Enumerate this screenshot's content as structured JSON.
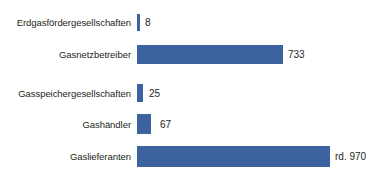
{
  "chart_data": {
    "type": "bar",
    "orientation": "horizontal",
    "title": "",
    "subtitle": "",
    "xlabel": "",
    "ylabel": "",
    "grid": false,
    "legend": null,
    "xlim": [
      0,
      970
    ],
    "bar_color": "#3d62a0",
    "background_color": "#ffffff",
    "label_color": "#231f20",
    "categories": [
      "Erdgasfördergesellschaften",
      "Gasnetzbetreiber",
      "Gasspeichergesellschaften",
      "Gashändler",
      "Gaslieferanten"
    ],
    "values": [
      8,
      733,
      25,
      67,
      970
    ],
    "value_labels": [
      "8",
      "733",
      "25",
      "67",
      "rd. 970"
    ],
    "bars": [
      {
        "category": "Erdgasfördergesellschaften",
        "value": 8,
        "value_label": "8",
        "bar_px": 3
      },
      {
        "category": "Gasnetzbetreiber",
        "value": 733,
        "value_label": "733",
        "bar_px": 146
      },
      {
        "category": "Gasspeichergesellschaften",
        "value": 25,
        "value_label": "25",
        "bar_px": 6
      },
      {
        "category": "Gashändler",
        "value": 67,
        "value_label": "67",
        "bar_px": 14
      },
      {
        "category": "Gaslieferanten",
        "value": 970,
        "value_label": "rd. 970",
        "bar_px": 193
      }
    ]
  }
}
